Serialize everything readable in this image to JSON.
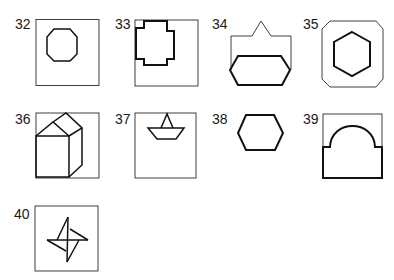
{
  "figures": [
    {
      "number": "32",
      "shape": "octagon-in-square"
    },
    {
      "number": "33",
      "shape": "cross-in-square"
    },
    {
      "number": "34",
      "shape": "hexagon-under-peaked-outline"
    },
    {
      "number": "35",
      "shape": "hexagon-in-octagon"
    },
    {
      "number": "36",
      "shape": "house-prism-in-square"
    },
    {
      "number": "37",
      "shape": "paper-boat-in-square"
    },
    {
      "number": "38",
      "shape": "hexagon"
    },
    {
      "number": "39",
      "shape": "arch-in-rectangle"
    },
    {
      "number": "40",
      "shape": "pinwheel-star-in-square"
    }
  ],
  "colors": {
    "line": "#111111",
    "background": "#ffffff"
  }
}
